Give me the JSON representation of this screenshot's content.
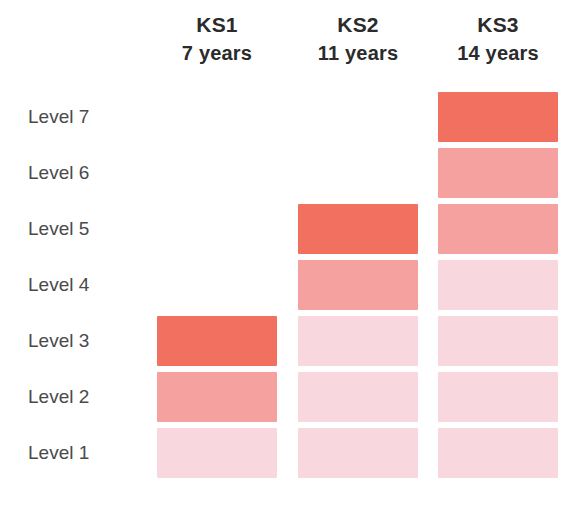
{
  "chart_data": {
    "type": "heatmap",
    "title": "",
    "subtitle": "",
    "xlabel": "",
    "ylabel": "",
    "legend_position": "none",
    "grid": false,
    "orientation": "columns-are-key-stages, rows-are-levels",
    "categories": [
      "KS1",
      "KS2",
      "KS3"
    ],
    "row_labels": [
      "Level 7",
      "Level 6",
      "Level 5",
      "Level 4",
      "Level 3",
      "Level 2",
      "Level 1"
    ],
    "row_values": [
      7,
      6,
      5,
      4,
      3,
      2,
      1
    ],
    "columns": [
      {
        "key_stage": "KS1",
        "age": "7 years",
        "age_years": 7,
        "top_level": 3,
        "levels_present": [
          1,
          2,
          3
        ],
        "cells": [
          {
            "level": 7,
            "present": false,
            "shade": "none"
          },
          {
            "level": 6,
            "present": false,
            "shade": "none"
          },
          {
            "level": 5,
            "present": false,
            "shade": "none"
          },
          {
            "level": 4,
            "present": false,
            "shade": "none"
          },
          {
            "level": 3,
            "present": true,
            "shade": "dark"
          },
          {
            "level": 2,
            "present": true,
            "shade": "medium"
          },
          {
            "level": 1,
            "present": true,
            "shade": "light"
          }
        ]
      },
      {
        "key_stage": "KS2",
        "age": "11 years",
        "age_years": 11,
        "top_level": 5,
        "levels_present": [
          1,
          2,
          3,
          4,
          5
        ],
        "cells": [
          {
            "level": 7,
            "present": false,
            "shade": "none"
          },
          {
            "level": 6,
            "present": false,
            "shade": "none"
          },
          {
            "level": 5,
            "present": true,
            "shade": "dark"
          },
          {
            "level": 4,
            "present": true,
            "shade": "medium"
          },
          {
            "level": 3,
            "present": true,
            "shade": "light"
          },
          {
            "level": 2,
            "present": true,
            "shade": "light"
          },
          {
            "level": 1,
            "present": true,
            "shade": "light"
          }
        ]
      },
      {
        "key_stage": "KS3",
        "age": "14 years",
        "age_years": 14,
        "top_level": 7,
        "levels_present": [
          1,
          2,
          3,
          4,
          5,
          6,
          7
        ],
        "cells": [
          {
            "level": 7,
            "present": true,
            "shade": "dark"
          },
          {
            "level": 6,
            "present": true,
            "shade": "medium"
          },
          {
            "level": 5,
            "present": true,
            "shade": "medium"
          },
          {
            "level": 4,
            "present": true,
            "shade": "light"
          },
          {
            "level": 3,
            "present": true,
            "shade": "light"
          },
          {
            "level": 2,
            "present": true,
            "shade": "light"
          },
          {
            "level": 1,
            "present": true,
            "shade": "light"
          }
        ]
      }
    ],
    "shades": {
      "dark": "#F2705F",
      "medium": "#F4A1A0",
      "light": "#F8D8DE",
      "none": "transparent"
    }
  },
  "headers": [
    {
      "name": "KS1",
      "age": "7 years"
    },
    {
      "name": "KS2",
      "age": "11 years"
    },
    {
      "name": "KS3",
      "age": "14 years"
    }
  ],
  "levels": [
    {
      "label": "Level 7"
    },
    {
      "label": "Level 6"
    },
    {
      "label": "Level 5"
    },
    {
      "label": "Level 4"
    },
    {
      "label": "Level 3"
    },
    {
      "label": "Level 2"
    },
    {
      "label": "Level 1"
    }
  ],
  "colors": {
    "background": "#FFFFFF",
    "header_text": "#2B2B2B",
    "label_text": "#4A4A4A",
    "block_dark": "#F2705F",
    "block_medium": "#F4A1A0",
    "block_light": "#F8D8DE"
  }
}
